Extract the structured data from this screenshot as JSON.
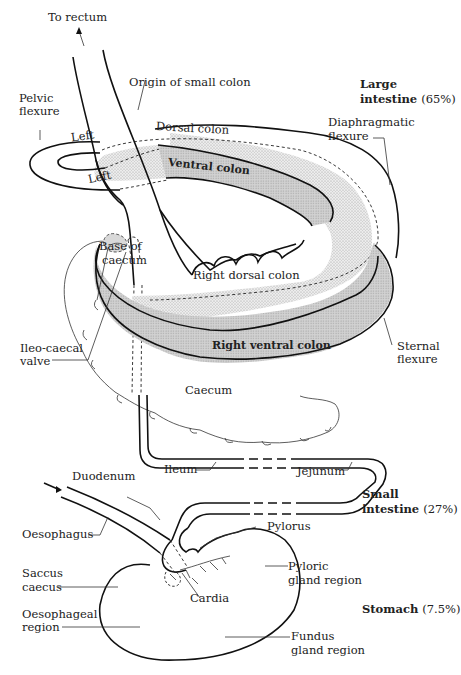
{
  "diagram": {
    "colors": {
      "outline": "#111111",
      "stipple_fill": "#d9d9d9",
      "ventral_fill": "#c8c8c8",
      "background": "#ffffff"
    },
    "labels": {
      "to_rectum": "To rectum",
      "origin_small_colon": "Origin of small colon",
      "pelvic_flexure_1": "Pelvic",
      "pelvic_flexure_2": "flexure",
      "left_upper": "Left",
      "left_lower": "Left",
      "dorsal_colon": "Dorsal colon",
      "ventral_colon": "Ventral colon",
      "diaphragmatic_flexure_1": "Diaphragmatic",
      "diaphragmatic_flexure_2": "flexure",
      "base_of_caecum_1": "Base of",
      "base_of_caecum_2": "caecum",
      "right_dorsal_colon": "Right dorsal colon",
      "right_ventral_colon": "Right ventral colon",
      "ileo_caecal_valve_1": "Ileo-caecal",
      "ileo_caecal_valve_2": "valve",
      "sternal_flexure_1": "Sternal",
      "sternal_flexure_2": "flexure",
      "caecum": "Caecum",
      "ileum": "Ileum",
      "jejunum": "Jejunum",
      "duodenum": "Duodenum",
      "oesophagus": "Oesophagus",
      "pylorus": "Pylorus",
      "saccus_caecus_1": "Saccus",
      "saccus_caecus_2": "caecus",
      "cardia": "Cardia",
      "pyloric_gland_region_1": "Pyloric",
      "pyloric_gland_region_2": "gland region",
      "oesophageal_region_1": "Oesophageal",
      "oesophageal_region_2": "region",
      "fundus_gland_region_1": "Fundus",
      "fundus_gland_region_2": "gland region"
    },
    "sections": {
      "large_intestine": {
        "name_1": "Large",
        "name_2": "intestine",
        "percent": "(65%)"
      },
      "small_intestine": {
        "name_1": "Small",
        "name_2": "intestine",
        "percent": "(27%)"
      },
      "stomach": {
        "name": "Stomach",
        "percent": "(7.5%)"
      }
    }
  }
}
